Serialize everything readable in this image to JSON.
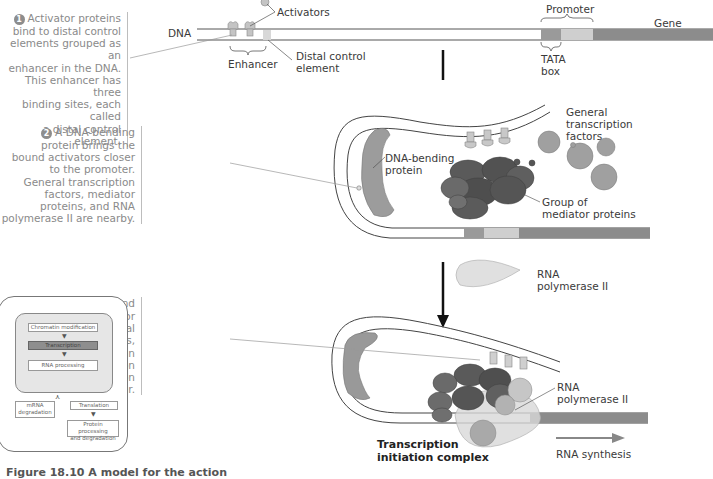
{
  "figure": {
    "caption_partial": "Figure 18.10 A model for the action",
    "colors": {
      "dna_line": "#555555",
      "tata_box": "#9a9a9a",
      "promoter_rest": "#cfcfcf",
      "gene": "#8c8c8c",
      "activator": "#c8c8c8",
      "mediator": "#5f5f5f",
      "general_factor": "#9e9e9e",
      "rna_pol": "#d9d9d9",
      "step_text": "#8a8a8a"
    }
  },
  "panel1": {
    "labels": {
      "dna": "DNA",
      "activators": "Activators",
      "enhancer": "Enhancer",
      "distal_control_element": [
        "Distal control",
        "element"
      ],
      "promoter": "Promoter",
      "gene": "Gene",
      "tata_box": [
        "TATA",
        "box"
      ]
    }
  },
  "steps": [
    {
      "number": "1",
      "lines": [
        "Activator proteins",
        "bind to distal control",
        "elements grouped as an",
        "enhancer in the DNA.",
        "This enhancer has three",
        "binding sites, each called",
        "a distal control element."
      ]
    },
    {
      "number": "2",
      "lines": [
        "A DNA-bending",
        "protein brings the",
        "bound activators closer",
        "to the promoter.",
        "General transcription",
        "factors, mediator",
        "proteins, and RNA",
        "polymerase II are nearby."
      ]
    },
    {
      "number": "3",
      "lines": [
        "The activators bind",
        "to certain mediator",
        "proteins and general",
        "transcription factors,",
        "helping them form an",
        "active transcription",
        "initiation complex on",
        "the promoter."
      ]
    }
  ],
  "panel2": {
    "labels": {
      "dna_bending_protein": [
        "DNA-bending",
        "protein"
      ],
      "general_transcription_factors": [
        "General",
        "transcription",
        "factors"
      ],
      "mediator_group": [
        "Group of",
        "mediator proteins"
      ]
    }
  },
  "panel3": {
    "labels": {
      "rna_pol_free": [
        "RNA",
        "polymerase II"
      ],
      "rna_pol_bound": [
        "RNA",
        "polymerase II"
      ],
      "complex": [
        "Transcription",
        "initiation complex"
      ],
      "rna_synthesis": "RNA synthesis"
    }
  },
  "inset_flow": {
    "boxes": {
      "chromatin": "Chromatin modification",
      "transcription": "Transcription",
      "rna_processing": "RNA processing",
      "mrna_degradation": [
        "mRNA",
        "degradation"
      ],
      "translation": "Translation",
      "protein_processing": [
        "Protein processing",
        "and degradation"
      ]
    },
    "highlight": "Transcription"
  }
}
